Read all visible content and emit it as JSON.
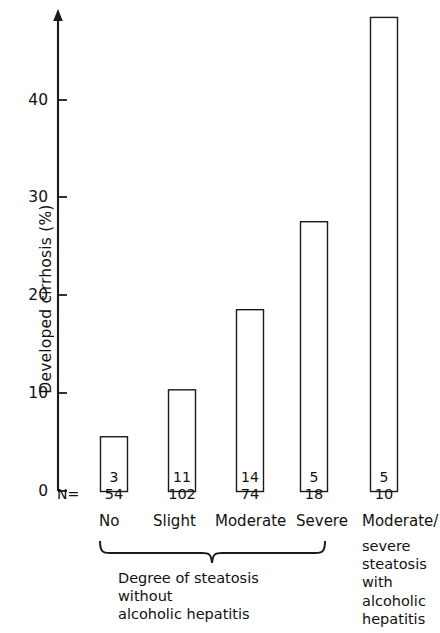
{
  "chart_data": {
    "type": "bar",
    "title": "",
    "xlabel": "Degree of steatosis",
    "ylabel": "Developed cirrhosis (%)",
    "ylim": [
      0,
      48
    ],
    "yticks": [
      0,
      10,
      20,
      30,
      40
    ],
    "ytick_labels": [
      "0",
      "10",
      "20",
      "30",
      "40"
    ],
    "grid": false,
    "legend": false,
    "categories": [
      "No",
      "Slight",
      "Moderate",
      "Severe",
      "Moderate/ severe steatosis with alcoholic hepatitis"
    ],
    "values": [
      5.6,
      10.4,
      18.6,
      27.6,
      48.5
    ],
    "bar_labels": [
      "3",
      "11",
      "14",
      "5",
      "5"
    ],
    "n_label": "N=",
    "n_values": [
      "54",
      "102",
      "74",
      "18",
      "10"
    ],
    "series": [
      {
        "name": "Developed cirrhosis (%)",
        "values": [
          5.6,
          10.4,
          18.6,
          27.6,
          48.5
        ]
      }
    ],
    "annotations": {
      "group_brace_caption": "Degree of steatosis without alcoholic hepatitis",
      "right_group_caption": "Moderate/ severe steatosis with alcoholic hepatitis"
    },
    "bar_style": {
      "fill": "#ffffff",
      "edge": "#1a1a1a",
      "edge_width": 1.4
    }
  },
  "axis": {
    "label": "Developed cirrhosis (%)",
    "tick_labels": [
      "0",
      "10",
      "20",
      "30",
      "40"
    ],
    "color": "#1a1a1a"
  },
  "bars": [
    {
      "category": "No",
      "value": "5.6",
      "count": "3",
      "n": "54"
    },
    {
      "category": "Slight",
      "value": "10.4",
      "count": "11",
      "n": "102"
    },
    {
      "category": "Moderate",
      "value": "18.6",
      "count": "14",
      "n": "74"
    },
    {
      "category": "Severe",
      "value": "27.6",
      "count": "5",
      "n": "18"
    },
    {
      "category": "Moderate/",
      "value": "48.5",
      "count": "5",
      "n": "10"
    }
  ],
  "labels": {
    "n_prefix": "N=",
    "cat_1": "No",
    "cat_2": "Slight",
    "cat_3": "Moderate",
    "cat_4": "Severe",
    "cat_5": "Moderate/",
    "brace_caption_line1": "Degree of steatosis",
    "brace_caption_line2": "without",
    "brace_caption_line3": "alcoholic hepatitis",
    "right_caption_line1": "severe",
    "right_caption_line2": "steatosis",
    "right_caption_line3": "with",
    "right_caption_line4": "alcoholic",
    "right_caption_line5": "hepatitis"
  },
  "ticks": {
    "t0": "0",
    "t10": "10",
    "t20": "20",
    "t30": "30",
    "t40": "40"
  }
}
